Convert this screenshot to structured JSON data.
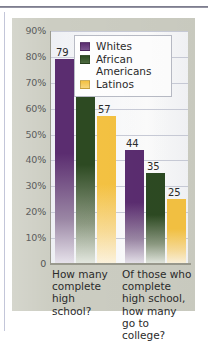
{
  "figure": {
    "panel_color": "#cccdc2",
    "plot_background": "#f7f8fa"
  },
  "legend": {
    "position": "top-right-inside",
    "entries": [
      {
        "label": "Whites",
        "color": "#5b2d70",
        "swatch_name": "legend-swatch-whites"
      },
      {
        "label": "African\nAmericans",
        "label_line1": "African",
        "label_line2": "Americans",
        "color": "#2d4a22",
        "swatch_name": "legend-swatch-african-americans"
      },
      {
        "label": "Latinos",
        "color": "#f5c242",
        "swatch_name": "legend-swatch-latinos"
      }
    ]
  },
  "axis": {
    "y_ticks": [
      "90%",
      "80%",
      "70%",
      "60%",
      "50%",
      "40%",
      "30%",
      "20%",
      "10%",
      "0"
    ]
  },
  "categories_text": {
    "cat0_line1": "How many",
    "cat0_line2": "complete",
    "cat0_line3": "high",
    "cat0_line4": "school?",
    "cat1_line1": "Of those who",
    "cat1_line2": "complete",
    "cat1_line3": "high school,",
    "cat1_line4": "how many",
    "cat1_line5": "go to college?"
  },
  "values_text": {
    "g0_whites": "79",
    "g0_african": "71",
    "g0_latinos": "57",
    "g1_whites": "44",
    "g1_african": "35",
    "g1_latinos": "25"
  },
  "chart_data": {
    "type": "bar",
    "title": "",
    "xlabel": "",
    "ylabel": "",
    "ylim": [
      0,
      90
    ],
    "ytick_values": [
      0,
      10,
      20,
      30,
      40,
      50,
      60,
      70,
      80,
      90
    ],
    "ytick_labels": [
      "0",
      "10%",
      "20%",
      "30%",
      "40%",
      "50%",
      "60%",
      "70%",
      "80%",
      "90%"
    ],
    "grid": true,
    "grid_axis": "y",
    "legend_position": "upper right",
    "categories": [
      "How many complete high school?",
      "Of those who complete high school, how many go to college?"
    ],
    "series": [
      {
        "name": "Whites",
        "color": "#5b2d70",
        "values": [
          79,
          71
        ]
      },
      {
        "name": "African Americans",
        "color": "#2d4a22",
        "values": [
          71,
          35
        ]
      },
      {
        "name": "Latinos",
        "color": "#f5c242",
        "values": [
          57,
          25
        ]
      }
    ],
    "series_corrected": [
      {
        "name": "Whites",
        "color": "#5b2d70",
        "values": [
          79,
          44
        ]
      },
      {
        "name": "African Americans",
        "color": "#2d4a22",
        "values": [
          71,
          35
        ]
      },
      {
        "name": "Latinos",
        "color": "#f5c242",
        "values": [
          57,
          25
        ]
      }
    ],
    "data_labels": [
      [
        79,
        71,
        57
      ],
      [
        44,
        35,
        25
      ]
    ],
    "bar_value_labels_shown": true
  }
}
